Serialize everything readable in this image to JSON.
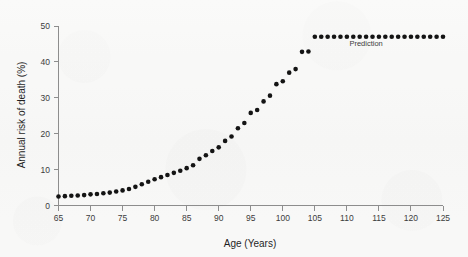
{
  "chart_data": {
    "type": "scatter",
    "title": "",
    "xlabel": "Age (Years)",
    "ylabel": "Annual risk of death (%)",
    "xlim": [
      65,
      125
    ],
    "ylim": [
      0,
      50
    ],
    "xticks": [
      65,
      70,
      75,
      80,
      85,
      90,
      95,
      100,
      105,
      110,
      115,
      120,
      125
    ],
    "yticks": [
      0,
      10,
      20,
      30,
      40,
      50
    ],
    "grid": false,
    "legend": "none",
    "marker": "filled-circle",
    "marker_color": "#141414",
    "background_color": "#f8f8f7",
    "axis_color": "#8d8d8d",
    "annotations": [
      {
        "text": "Prediction",
        "x": 113,
        "y": 44.5,
        "describes": "flat plateau of predicted annual risk beyond age 105"
      }
    ],
    "series": [
      {
        "name": "Observed annual risk of death",
        "x": [
          65,
          66,
          67,
          68,
          69,
          70,
          71,
          72,
          73,
          74,
          75,
          76,
          77,
          78,
          79,
          80,
          81,
          82,
          83,
          84,
          85,
          86,
          87,
          88,
          89,
          90,
          91,
          92,
          93,
          94,
          95,
          96,
          97,
          98,
          99,
          100,
          101,
          102,
          103,
          104
        ],
        "values": [
          2.5,
          2.6,
          2.7,
          2.8,
          2.9,
          3.1,
          3.2,
          3.4,
          3.6,
          3.9,
          4.2,
          4.6,
          5.2,
          5.9,
          6.6,
          7.3,
          7.9,
          8.5,
          9.1,
          9.7,
          10.4,
          11.2,
          13.0,
          14.0,
          15.2,
          16.2,
          18.0,
          19.2,
          21.5,
          23.0,
          25.8,
          26.6,
          29.0,
          30.6,
          33.8,
          34.6,
          37.0,
          38.0,
          42.8,
          42.9
        ]
      },
      {
        "name": "Prediction",
        "x": [
          105,
          106,
          107,
          108,
          109,
          110,
          111,
          112,
          113,
          114,
          115,
          116,
          117,
          118,
          119,
          120,
          121,
          122,
          123,
          124,
          125
        ],
        "values": [
          47.0,
          47.0,
          47.0,
          47.0,
          47.0,
          47.0,
          47.0,
          47.0,
          47.0,
          47.0,
          47.0,
          47.0,
          47.0,
          47.0,
          47.0,
          47.0,
          47.0,
          47.0,
          47.0,
          47.0,
          47.0
        ]
      }
    ]
  }
}
